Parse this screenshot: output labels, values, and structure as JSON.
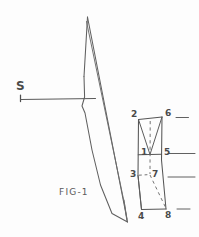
{
  "figure": {
    "caption": "FIG-1",
    "background_color": "#fdfdfd",
    "ink_color": "#545454",
    "source": {
      "label": "S",
      "tick_present": true,
      "ray_description": "horizontal-ray"
    },
    "plane": {
      "name": "oblique-plane",
      "description": "large elongated parallelogram representing a plane"
    },
    "prism": {
      "name": "rectangular-prism",
      "description": "rectangular box in oblique projection with eight numbered vertices",
      "vertices": [
        {
          "id": "1",
          "label": "1",
          "position": "mid-left-front"
        },
        {
          "id": "2",
          "label": "2",
          "position": "top-left-front"
        },
        {
          "id": "3",
          "label": "3",
          "position": "lower-left-front"
        },
        {
          "id": "4",
          "label": "4",
          "position": "bottom-left-front"
        },
        {
          "id": "5",
          "label": "5",
          "position": "mid-right-front"
        },
        {
          "id": "6",
          "label": "6",
          "position": "top-right-back"
        },
        {
          "id": "7",
          "label": "7",
          "position": "lower-center-hidden"
        },
        {
          "id": "8",
          "label": "8",
          "position": "bottom-right-front"
        }
      ],
      "hidden_edges": [
        "6-7 vertical dashed",
        "7-8 diagonal dashed"
      ],
      "leader_lines": [
        {
          "from_vertex": "6"
        },
        {
          "from_vertex": "5"
        },
        {
          "from_vertex": "7"
        },
        {
          "from_vertex": "8"
        }
      ]
    }
  }
}
